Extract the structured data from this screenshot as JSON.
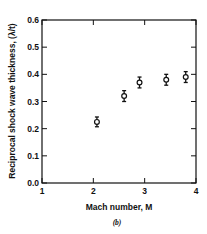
{
  "chart_data": {
    "type": "scatter",
    "title": "",
    "caption": "(b)",
    "xlabel": "Mach number, M",
    "ylabel": "Reciprocal shock wave thickness, (λ/t)",
    "xlim": [
      1,
      4
    ],
    "ylim": [
      0.0,
      0.6
    ],
    "xticks": [
      1,
      2,
      3,
      4
    ],
    "xtick_labels": [
      "1",
      "2",
      "3",
      "4"
    ],
    "yticks": [
      0.0,
      0.1,
      0.2,
      0.3,
      0.4,
      0.5,
      0.6
    ],
    "ytick_labels": [
      "0.0",
      "0.1",
      "0.2",
      "0.3",
      "0.4",
      "0.5",
      "0.6"
    ],
    "grid": false,
    "legend": null,
    "marker": "open-circle-with-error-bars",
    "series": [
      {
        "name": "measurements",
        "x": [
          2.07,
          2.6,
          2.9,
          3.42,
          3.8
        ],
        "y": [
          0.225,
          0.32,
          0.37,
          0.38,
          0.39
        ],
        "yerr": [
          0.018,
          0.02,
          0.02,
          0.02,
          0.02
        ]
      }
    ]
  },
  "labels": {
    "xlabel": "Mach number, M",
    "ylabel": "Reciprocal shock wave thickness, (λ/t)",
    "caption": "(b)"
  }
}
